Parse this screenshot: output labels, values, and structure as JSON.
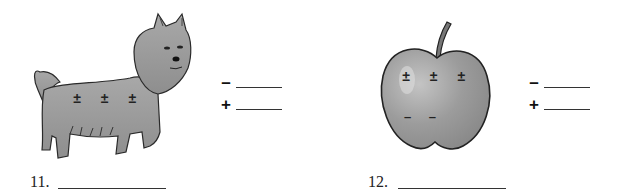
{
  "questions": [
    {
      "number": "11.",
      "object": "dog",
      "object_icon": "terrier-dog-illustration",
      "charges_on_object": [
        "±",
        "±",
        "±"
      ],
      "answer_blanks": [
        {
          "sign": "–",
          "value": ""
        },
        {
          "sign": "+",
          "value": ""
        }
      ],
      "answer_value": ""
    },
    {
      "number": "12.",
      "object": "apple",
      "object_icon": "apple-illustration",
      "charges_on_object": [
        "±",
        "±",
        "±"
      ],
      "extra_charges": [
        "–",
        "–"
      ],
      "answer_blanks": [
        {
          "sign": "–",
          "value": ""
        },
        {
          "sign": "+",
          "value": ""
        }
      ],
      "answer_value": ""
    }
  ],
  "colors": {
    "fill_gray": "#9a9a9a",
    "outline": "#2a2a2a",
    "paper": "#ffffff"
  }
}
